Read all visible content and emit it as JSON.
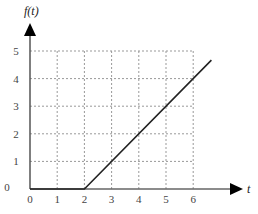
{
  "chart_data": {
    "type": "line",
    "title": "",
    "xlabel": "t",
    "ylabel": "f(t)",
    "x_ticks": [
      "0",
      "1",
      "2",
      "3",
      "4",
      "5",
      "6"
    ],
    "y_ticks": [
      "0",
      "1",
      "2",
      "3",
      "4",
      "5"
    ],
    "xlim": [
      0,
      6.7
    ],
    "ylim": [
      0,
      5.5
    ],
    "grid": true,
    "grid_style": "dashed",
    "legend": null,
    "series": [
      {
        "name": "f(t)",
        "x": [
          0,
          2,
          6.67
        ],
        "y": [
          0,
          0,
          4.67
        ],
        "color": "#222222"
      }
    ]
  },
  "axes": {
    "x_label": "t",
    "y_label": "f(t)"
  },
  "colors": {
    "axis": "#555555",
    "grid": "#999999",
    "line": "#222222"
  }
}
